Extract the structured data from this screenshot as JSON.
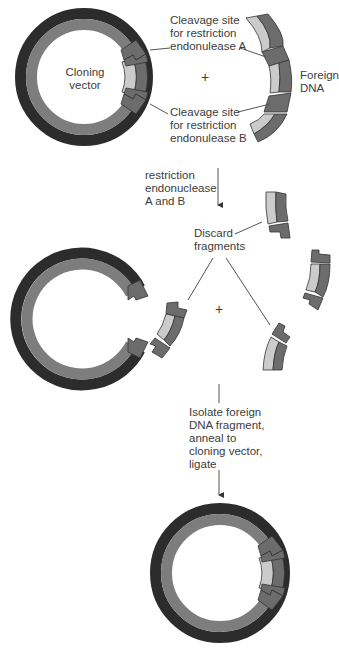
{
  "labels": {
    "cloning_vector": [
      "Cloning",
      "vector"
    ],
    "cleavage_a": [
      "Cleavage site",
      "for restriction",
      "endonulease A"
    ],
    "cleavage_b": [
      "Cleavage site",
      "for restriction",
      "endonulease B"
    ],
    "foreign_dna": [
      "Foreign",
      "DNA"
    ],
    "plus_top": "+",
    "step1": [
      "restriction",
      "endonuclease",
      "A and B"
    ],
    "discard": [
      "Discard",
      "fragments"
    ],
    "plus_mid": "+",
    "step2": [
      "Isolate foreign",
      "DNA fragment,",
      "anneal to",
      "cloning vector,",
      "ligate"
    ]
  },
  "colors": {
    "outer_strand": "#2c2c2c",
    "inner_strand": "#7d7d7d",
    "insert_outer": "#6c6c6c",
    "insert_inner": "#cbcbcb",
    "line": "#555555"
  }
}
